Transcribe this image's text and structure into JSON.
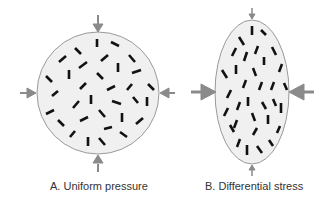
{
  "panels": [
    {
      "id": "A",
      "caption": "A. Uniform pressure",
      "shape": "circle"
    },
    {
      "id": "B",
      "caption": "B. Differential stress",
      "shape": "ellipse"
    }
  ],
  "colors": {
    "fill": "#f0f0f0",
    "outline": "#9a9a9a",
    "grain": "#111111",
    "arrow": "#8a8a8a"
  }
}
